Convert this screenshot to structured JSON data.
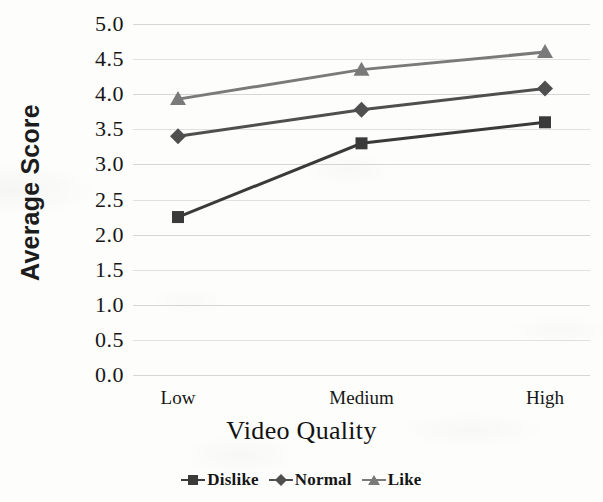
{
  "chart_data": {
    "type": "line",
    "title": "",
    "xlabel": "Video Quality",
    "ylabel": "Average Score",
    "categories": [
      "Low",
      "Medium",
      "High"
    ],
    "series": [
      {
        "name": "Dislike",
        "values": [
          2.25,
          3.3,
          3.6
        ],
        "marker": "square",
        "color": "#3a3a3a"
      },
      {
        "name": "Normal",
        "values": [
          3.4,
          3.78,
          4.08
        ],
        "marker": "diamond",
        "color": "#4f4f4f"
      },
      {
        "name": "Like",
        "values": [
          3.93,
          4.35,
          4.6
        ],
        "marker": "triangle",
        "color": "#7a7a7a"
      }
    ],
    "ylim": [
      0.0,
      5.0
    ],
    "ytick_labels": [
      "5.0",
      "4.5",
      "4.0",
      "3.5",
      "3.0",
      "2.5",
      "2.0",
      "1.5",
      "1.0",
      "0.5",
      "0.0"
    ],
    "ytick_values": [
      5.0,
      4.5,
      4.0,
      3.5,
      3.0,
      2.5,
      2.0,
      1.5,
      1.0,
      0.5,
      0.0
    ],
    "grid": true,
    "grid_color": "#cfcfcf",
    "legend_position": "bottom"
  },
  "axes": {
    "y_title": "Average Score",
    "x_title": "Video Quality"
  },
  "legend": {
    "items": [
      {
        "label": "Dislike",
        "marker": "square-marker-icon",
        "color": "#3a3a3a"
      },
      {
        "label": "Normal",
        "marker": "diamond-marker-icon",
        "color": "#4f4f4f"
      },
      {
        "label": "Like",
        "marker": "triangle-marker-icon",
        "color": "#7a7a7a"
      }
    ]
  }
}
